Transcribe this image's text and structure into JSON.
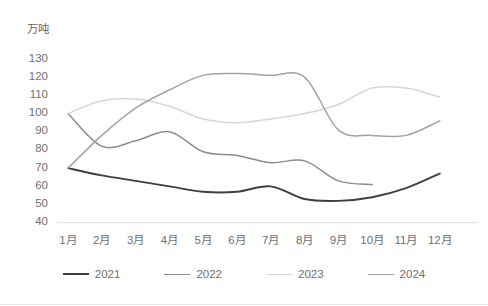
{
  "chart_data": {
    "type": "line",
    "title": "",
    "subtitle": "",
    "xlabel": "",
    "ylabel": "万吨",
    "unit_label": "万吨",
    "categories": [
      "1月",
      "2月",
      "3月",
      "4月",
      "5月",
      "6月",
      "7月",
      "8月",
      "9月",
      "10月",
      "11月",
      "12月"
    ],
    "ylim": [
      40,
      130
    ],
    "ytick_values": [
      130,
      120,
      110,
      100,
      90,
      80,
      70,
      60,
      50,
      40
    ],
    "ytick_labels": [
      "130",
      "120",
      "110",
      "100",
      "90",
      "80",
      "70",
      "60",
      "50",
      "40"
    ],
    "grid": false,
    "smooth": true,
    "legend_position": "bottom",
    "series": [
      {
        "name": "2021",
        "color": "#3f3f3f",
        "values": [
          70,
          66,
          63,
          60,
          57,
          57,
          60,
          53,
          52,
          54,
          59,
          67
        ]
      },
      {
        "name": "2022",
        "color": "#8c8c8c",
        "values": [
          100,
          82,
          85,
          90,
          79,
          77,
          73,
          74,
          63,
          61,
          null,
          null
        ]
      },
      {
        "name": "2023",
        "color": "#d6d6d6",
        "values": [
          100,
          107,
          108,
          104,
          97,
          95,
          97,
          100,
          105,
          114,
          114,
          109
        ]
      },
      {
        "name": "2024",
        "color": "#a3a3a3",
        "values": [
          70,
          88,
          103,
          113,
          121,
          122,
          121,
          120,
          91,
          88,
          88,
          96
        ]
      }
    ]
  },
  "legend": {
    "items": [
      {
        "label": "2021",
        "color": "#3f3f3f"
      },
      {
        "label": "2022",
        "color": "#8c8c8c"
      },
      {
        "label": "2023",
        "color": "#d6d6d6"
      },
      {
        "label": "2024",
        "color": "#a3a3a3"
      }
    ]
  }
}
